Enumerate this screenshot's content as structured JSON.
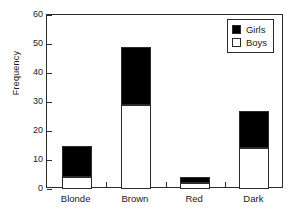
{
  "chart_data": {
    "type": "bar",
    "stacked": true,
    "title": "",
    "xlabel": "",
    "ylabel": "Frequency",
    "categories": [
      "Blonde",
      "Brown",
      "Red",
      "Dark"
    ],
    "series": [
      {
        "name": "Boys",
        "color": "#ffffff",
        "values": [
          4,
          29,
          2,
          14
        ]
      },
      {
        "name": "Girls",
        "color": "#000000",
        "values": [
          11,
          20,
          2,
          13
        ]
      }
    ],
    "totals": [
      15,
      49,
      4,
      27
    ],
    "ylim": [
      0,
      60
    ],
    "yticks": [
      0,
      10,
      20,
      30,
      40,
      50,
      60
    ],
    "ytick_labels": [
      "0",
      "10",
      "20",
      "30",
      "40",
      "50",
      "60"
    ],
    "grid": false,
    "legend_position": "top-right",
    "legend_entries": [
      {
        "label": "Girls",
        "swatch": "filled-black-square"
      },
      {
        "label": "Boys",
        "swatch": "open-white-square"
      }
    ],
    "axis_color": "#2b2b2b",
    "background": "#ffffff"
  }
}
